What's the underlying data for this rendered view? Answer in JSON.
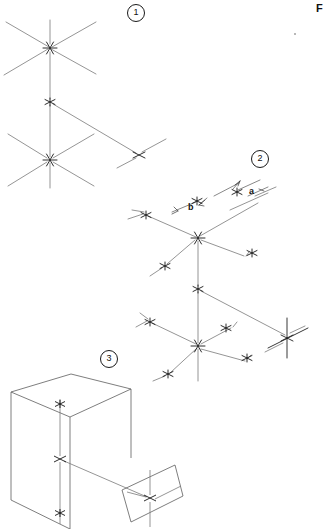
{
  "figure": {
    "page_label": "F",
    "callouts": [
      {
        "id": "callout-1",
        "label": "1",
        "x": 127,
        "y": 4
      },
      {
        "id": "callout-2",
        "label": "2",
        "x": 251,
        "y": 150
      },
      {
        "id": "callout-3",
        "label": "3",
        "x": 100,
        "y": 350
      }
    ],
    "dimension_labels": [
      {
        "id": "dim-a",
        "label": "a",
        "x": 249,
        "y": 186
      },
      {
        "id": "dim-b",
        "label": "b",
        "x": 188,
        "y": 202
      }
    ],
    "stroke_colors": {
      "line": "#7a7a7a",
      "line_dark": "#3c3c3c",
      "node": "#141414",
      "box": "#5d5d5d",
      "text": "#111111"
    },
    "diagrams": [
      {
        "id": "diagram-1",
        "name": "hexagonal-junction-network-1",
        "description": "Isometric network of three six-armed star junctions connected by vertical and diagonal struts",
        "nodes": [
          {
            "id": "d1-n1",
            "x": 50,
            "y": 48,
            "arms": 6
          },
          {
            "id": "d1-n2",
            "x": 50,
            "y": 102,
            "arms": 3
          },
          {
            "id": "d1-n3",
            "x": 50,
            "y": 160,
            "arms": 6
          },
          {
            "id": "d1-n4",
            "x": 139,
            "y": 155,
            "arms": 4
          }
        ],
        "edges": [
          {
            "from": [
              8,
              24
            ],
            "to": [
              96,
              74
            ]
          },
          {
            "from": [
              96,
              24
            ],
            "to": [
              8,
              74
            ]
          },
          {
            "from": [
              50,
              24
            ],
            "to": [
              50,
              186
            ]
          },
          {
            "from": [
              50,
              102
            ],
            "to": [
              139,
              155
            ]
          },
          {
            "from": [
              8,
              136
            ],
            "to": [
              96,
              186
            ]
          },
          {
            "from": [
              96,
              136
            ],
            "to": [
              8,
              186
            ]
          },
          {
            "from": [
              116,
              167
            ],
            "to": [
              163,
              140
            ]
          }
        ]
      },
      {
        "id": "diagram-2",
        "name": "hexagonal-junction-network-2",
        "description": "Larger isometric network with dimension callouts a and b, five star junctions",
        "nodes": [
          {
            "id": "d2-n1",
            "x": 198,
            "y": 238,
            "arms": 6
          },
          {
            "id": "d2-n2",
            "x": 198,
            "y": 289,
            "arms": 3
          },
          {
            "id": "d2-n3",
            "x": 198,
            "y": 346,
            "arms": 6
          },
          {
            "id": "d2-n4",
            "x": 287,
            "y": 338,
            "arms": 4
          },
          {
            "id": "d2-n5",
            "x": 146,
            "y": 215,
            "arms": 3
          },
          {
            "id": "d2-n6",
            "x": 253,
            "y": 253,
            "arms": 3
          },
          {
            "id": "d2-n7",
            "x": 165,
            "y": 266,
            "arms": 3
          },
          {
            "id": "d2-n8",
            "x": 150,
            "y": 322,
            "arms": 3
          },
          {
            "id": "d2-n9",
            "x": 226,
            "y": 328,
            "arms": 3
          },
          {
            "id": "d2-n10",
            "x": 247,
            "y": 358,
            "arms": 3
          },
          {
            "id": "d2-n11",
            "x": 168,
            "y": 374,
            "arms": 3
          }
        ],
        "edges": [
          {
            "from": [
              140,
              215
            ],
            "to": [
              198,
              238
            ]
          },
          {
            "from": [
              198,
              238
            ],
            "to": [
              265,
              200
            ]
          },
          {
            "from": [
              198,
              238
            ],
            "to": [
              198,
              380
            ]
          },
          {
            "from": [
              165,
              266
            ],
            "to": [
              198,
              238
            ]
          },
          {
            "from": [
              198,
              238
            ],
            "to": [
              245,
              256
            ]
          },
          {
            "from": [
              198,
              289
            ],
            "to": [
              290,
              333
            ]
          },
          {
            "from": [
              198,
              346
            ],
            "to": [
              150,
              322
            ]
          },
          {
            "from": [
              198,
              346
            ],
            "to": [
              233,
              327
            ]
          },
          {
            "from": [
              198,
              346
            ],
            "to": [
              168,
              374
            ]
          },
          {
            "from": [
              198,
              346
            ],
            "to": [
              246,
              360
            ]
          },
          {
            "from": [
              270,
              322
            ],
            "to": [
              305,
              340
            ]
          }
        ]
      },
      {
        "id": "diagram-3",
        "name": "box-and-plane-assembly",
        "description": "Isometric rectangular box with vertical axis of three junctions and a separate planar quadrilateral with a junction",
        "box": {
          "top_face": [
            [
              10,
              392
            ],
            [
              70,
              374
            ],
            [
              131,
              389
            ],
            [
              70,
              416
            ]
          ],
          "left_face": [
            [
              10,
              392
            ],
            [
              10,
              500
            ],
            [
              70,
              529
            ],
            [
              70,
              416
            ]
          ],
          "right_face": [
            [
              70,
              416
            ],
            [
              131,
              389
            ],
            [
              131,
              457
            ]
          ]
        },
        "plane": {
          "quad": [
            [
              122,
              490
            ],
            [
              175,
              465
            ],
            [
              183,
              495
            ],
            [
              131,
              522
            ]
          ]
        },
        "nodes": [
          {
            "id": "d3-n1",
            "x": 60,
            "y": 404,
            "arms": 2
          },
          {
            "id": "d3-n2",
            "x": 60,
            "y": 459,
            "arms": 4
          },
          {
            "id": "d3-n3",
            "x": 60,
            "y": 513,
            "arms": 2
          },
          {
            "id": "d3-n4",
            "x": 150,
            "y": 498,
            "arms": 4
          }
        ],
        "edges": [
          {
            "from": [
              60,
              398
            ],
            "to": [
              60,
              524
            ]
          },
          {
            "from": [
              60,
              459
            ],
            "to": [
              150,
              498
            ]
          },
          {
            "from": [
              150,
              470
            ],
            "to": [
              150,
              526
            ]
          },
          {
            "from": [
              126,
              491
            ],
            "to": [
              181,
              485
            ]
          }
        ]
      }
    ]
  }
}
